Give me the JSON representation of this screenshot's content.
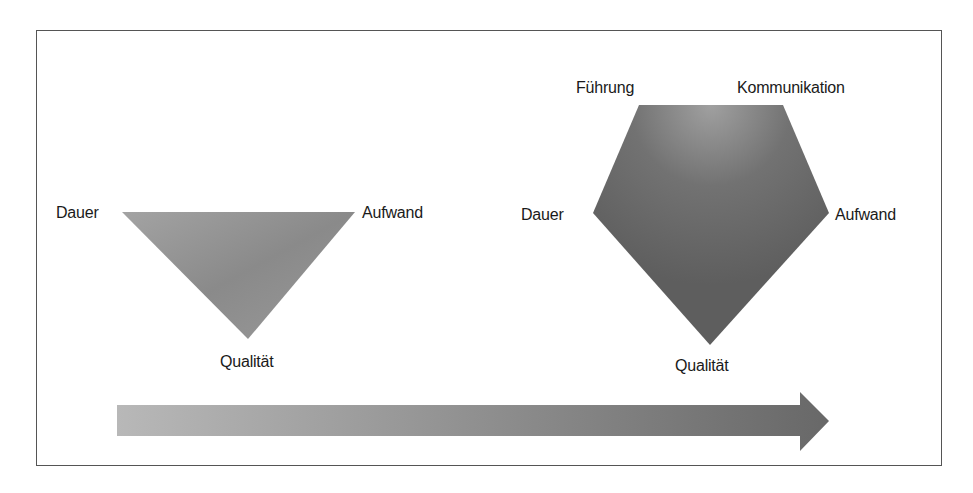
{
  "diagram": {
    "type": "project-management-triangle-to-pentagon",
    "triangle": {
      "labels": {
        "top_left": "Dauer",
        "top_right": "Aufwand",
        "bottom": "Qualität"
      }
    },
    "pentagon": {
      "labels": {
        "top_left": "Führung",
        "top_right": "Kommunikation",
        "left": "Dauer",
        "right": "Aufwand",
        "bottom": "Qualität"
      }
    },
    "arrow": {
      "direction": "right"
    },
    "colors": {
      "border": "#555555",
      "triangle_fill": "#8c8c8c",
      "pentagon_fill": "#6e6e6e",
      "arrow_start": "#b4b4b4",
      "arrow_end": "#6a6a6a",
      "text": "#1a1a1a"
    }
  }
}
